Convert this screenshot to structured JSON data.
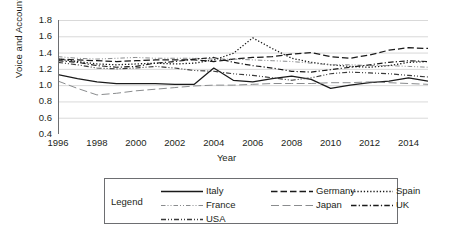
{
  "chart_data": {
    "type": "line",
    "title": "",
    "xlabel": "Year",
    "ylabel": "Voice and Accountability",
    "xlim": [
      1996,
      2015
    ],
    "ylim": [
      0.4,
      1.8
    ],
    "ytick_values": [
      1.8,
      1.6,
      1.4,
      1.2,
      1.0,
      0.8,
      0.6,
      0.4
    ],
    "ytick_labels": [
      "1.8",
      "1.6",
      "1.4",
      "1.2",
      "1.0",
      "0.8",
      "0.6",
      "0.4"
    ],
    "xtick_values": [
      1996,
      1998,
      2000,
      2002,
      2004,
      2006,
      2008,
      2010,
      2012,
      2014
    ],
    "xtick_labels": [
      "1996",
      "1998",
      "2000",
      "2002",
      "2004",
      "2006",
      "2008",
      "2010",
      "2012",
      "2014"
    ],
    "x": [
      1996,
      1997,
      1998,
      1999,
      2000,
      2001,
      2002,
      2003,
      2004,
      2005,
      2006,
      2007,
      2008,
      2009,
      2010,
      2011,
      2012,
      2013,
      2014,
      2015
    ],
    "grid": "horizontal",
    "legend_position": "bottom",
    "series": [
      {
        "name": "Italy",
        "style": "solid",
        "color": "#1a1a1a",
        "values": [
          1.13,
          1.08,
          1.04,
          1.02,
          1.02,
          1.02,
          1.01,
          1.01,
          1.21,
          1.06,
          1.04,
          1.08,
          1.11,
          1.07,
          0.96,
          1.0,
          1.03,
          1.05,
          1.09,
          1.05
        ]
      },
      {
        "name": "Germany",
        "style": "dash",
        "color": "#1a1a1a",
        "values": [
          1.32,
          1.31,
          1.3,
          1.29,
          1.3,
          1.31,
          1.31,
          1.31,
          1.29,
          1.32,
          1.34,
          1.35,
          1.38,
          1.4,
          1.35,
          1.33,
          1.37,
          1.43,
          1.46,
          1.45
        ]
      },
      {
        "name": "Spain",
        "style": "dot",
        "color": "#1a1a1a",
        "values": [
          1.32,
          1.29,
          1.26,
          1.25,
          1.26,
          1.27,
          1.26,
          1.27,
          1.31,
          1.39,
          1.58,
          1.45,
          1.33,
          1.28,
          1.25,
          1.23,
          1.22,
          1.24,
          1.28,
          1.29
        ]
      },
      {
        "name": "France",
        "style": "dashdotdot-light",
        "color": "#808285",
        "values": [
          1.35,
          1.33,
          1.32,
          1.33,
          1.34,
          1.33,
          1.33,
          1.33,
          1.32,
          1.32,
          1.31,
          1.3,
          1.29,
          1.27,
          1.25,
          1.25,
          1.24,
          1.24,
          1.23,
          1.22
        ]
      },
      {
        "name": "Japan",
        "style": "longdash-light",
        "color": "#808285",
        "values": [
          1.05,
          0.96,
          0.88,
          0.9,
          0.93,
          0.95,
          0.97,
          0.99,
          1.0,
          1.0,
          1.01,
          1.02,
          1.02,
          1.02,
          1.03,
          1.03,
          1.04,
          1.03,
          1.02,
          1.01
        ]
      },
      {
        "name": "UK",
        "style": "dashdot",
        "color": "#1a1a1a",
        "values": [
          1.3,
          1.28,
          1.24,
          1.22,
          1.23,
          1.27,
          1.29,
          1.32,
          1.34,
          1.28,
          1.24,
          1.21,
          1.17,
          1.16,
          1.19,
          1.22,
          1.25,
          1.28,
          1.3,
          1.29
        ]
      },
      {
        "name": "USA",
        "style": "dashdotdot",
        "color": "#1a1a1a",
        "values": [
          1.28,
          1.25,
          1.21,
          1.2,
          1.21,
          1.23,
          1.21,
          1.18,
          1.17,
          1.14,
          1.12,
          1.09,
          1.06,
          1.09,
          1.14,
          1.16,
          1.15,
          1.14,
          1.12,
          1.1
        ]
      }
    ]
  },
  "legend": {
    "title": "Legend",
    "entries": [
      {
        "label": "Italy",
        "style": "solid"
      },
      {
        "label": "Germany",
        "style": "dash"
      },
      {
        "label": "Spain",
        "style": "dot"
      },
      {
        "label": "France",
        "style": "dashdotdot-light"
      },
      {
        "label": "Japan",
        "style": "longdash-light"
      },
      {
        "label": "UK",
        "style": "dashdot"
      },
      {
        "label": "USA",
        "style": "dashdotdot"
      }
    ]
  },
  "colors": {
    "ink": "#231f20",
    "line_dark": "#1a1a1a",
    "line_light": "#808285",
    "grid": "#d9d9d9",
    "axis": "#6d6e71"
  }
}
